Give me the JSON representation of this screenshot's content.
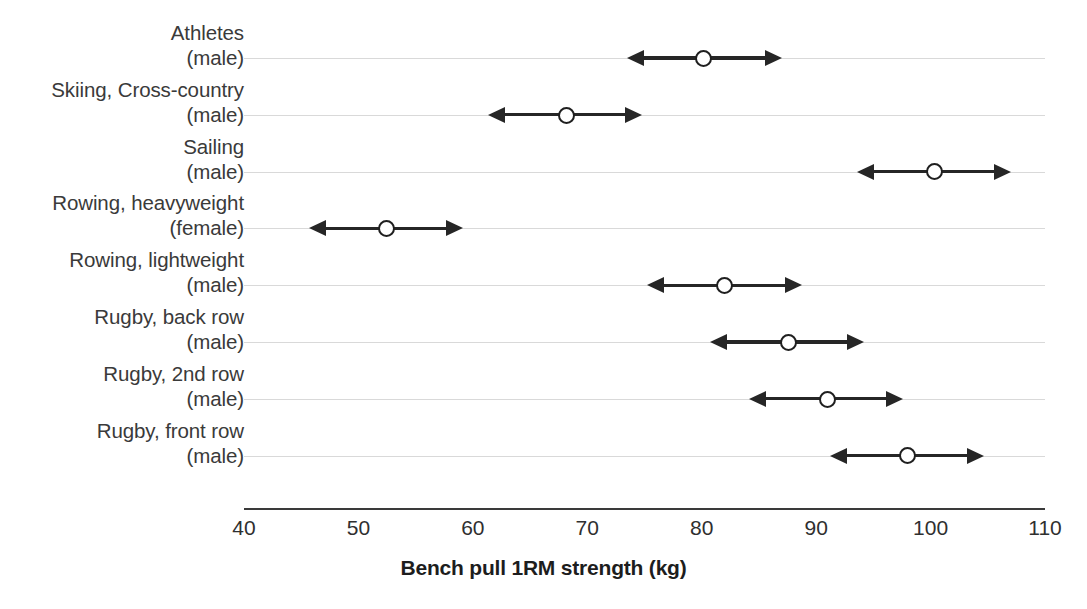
{
  "chart_data": {
    "type": "bar",
    "title": "",
    "xlabel": "Bench pull 1RM strength (kg)",
    "ylabel": "",
    "xlim": [
      40,
      110
    ],
    "xticks": [
      40,
      50,
      60,
      70,
      80,
      90,
      100,
      110
    ],
    "xticklabels": [
      "40",
      "50",
      "60",
      "70",
      "80",
      "90",
      "100",
      "110"
    ],
    "grid": true,
    "legend": null,
    "orientation": "horizontal",
    "marker": "open-circle",
    "error_style": "double-headed-arrow",
    "categories": [
      "Athletes (male)",
      "Skiing, Cross-country (male)",
      "Sailing (male)",
      "Rowing, heavyweight (female)",
      "Rowing, lightweight (male)",
      "Rugby, back row (male)",
      "Rugby, 2nd row (male)",
      "Rugby, front row (male)"
    ],
    "values": [
      80.2,
      68.2,
      100.4,
      52.5,
      82.0,
      87.6,
      91.0,
      98.0
    ],
    "range_low": [
      73.5,
      61.3,
      93.6,
      45.7,
      75.2,
      80.7,
      84.1,
      91.2
    ],
    "range_high": [
      87.0,
      74.8,
      107.0,
      59.1,
      88.8,
      94.2,
      97.6,
      104.7
    ],
    "points": [
      {
        "label_line1": "Athletes",
        "label_line2": "(male)",
        "value": 80.2,
        "low": 73.5,
        "high": 87.0
      },
      {
        "label_line1": "Skiing, Cross-country",
        "label_line2": "(male)",
        "value": 68.2,
        "low": 61.3,
        "high": 74.8
      },
      {
        "label_line1": "Sailing",
        "label_line2": "(male)",
        "value": 100.4,
        "low": 93.6,
        "high": 107.0
      },
      {
        "label_line1": "Rowing, heavyweight",
        "label_line2": "(female)",
        "value": 52.5,
        "low": 45.7,
        "high": 59.1
      },
      {
        "label_line1": "Rowing, lightweight",
        "label_line2": "(male)",
        "value": 82.0,
        "low": 75.2,
        "high": 88.8
      },
      {
        "label_line1": "Rugby, back row",
        "label_line2": "(male)",
        "value": 87.6,
        "low": 80.7,
        "high": 94.2
      },
      {
        "label_line1": "Rugby, 2nd row",
        "label_line2": "(male)",
        "value": 91.0,
        "low": 84.1,
        "high": 97.6
      },
      {
        "label_line1": "Rugby, front row",
        "label_line2": "(male)",
        "value": 98.0,
        "low": 91.2,
        "high": 104.7
      }
    ],
    "colors": {
      "marker_stroke": "#1f1f1f",
      "marker_fill": "#ffffff",
      "bar": "#262626",
      "gridline": "#d9d9d9",
      "axis": "#3a3a3a",
      "text": "#2b2b2b",
      "background": "#ffffff"
    }
  }
}
